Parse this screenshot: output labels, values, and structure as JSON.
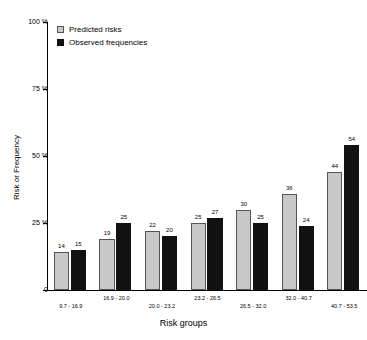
{
  "chart_data": {
    "type": "bar",
    "title": "",
    "xlabel": "Risk groups",
    "ylabel": "Risk or Frequency",
    "ylim": [
      0,
      100
    ],
    "grid": false,
    "legend_position": "top-left",
    "ytick_labels": [
      "0",
      "25 %",
      "50 %",
      "75 %",
      "100 %"
    ],
    "ytick_values": [
      0,
      25,
      50,
      75,
      100
    ],
    "categories": [
      "9.7 - 16.9",
      "16.9 - 20.0",
      "20.0 - 23.2",
      "23.2 - 26.5",
      "26.5 - 32.0",
      "32.0 - 40.7",
      "40.7 - 53.5"
    ],
    "series": [
      {
        "name": "Predicted risks",
        "color": "#c8c8c8",
        "values": [
          14,
          19,
          22,
          25,
          30,
          36,
          44
        ]
      },
      {
        "name": "Observed frequencies",
        "color": "#111111",
        "values": [
          15,
          25,
          20,
          27,
          25,
          24,
          54
        ]
      }
    ]
  },
  "legend": {
    "items": [
      {
        "label": "Predicted risks",
        "swatch": "predicted-swatch-icon"
      },
      {
        "label": "Observed frequencies",
        "swatch": "observed-swatch-icon"
      }
    ]
  }
}
